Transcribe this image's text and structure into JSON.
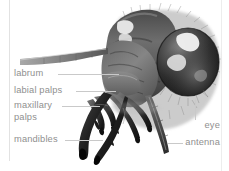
{
  "figure": {
    "background_color": "#ffffff",
    "label_color": "#8f8f8f",
    "leader_color": "#c9c9c9",
    "rule_color": "#e2e2e2"
  },
  "labels": {
    "labrum": "labrum",
    "labial_palps": "labial palps",
    "maxillary": "maxillary",
    "palps": "palps",
    "mandibles": "mandibles",
    "eye": "eye",
    "antenna": "antenna"
  }
}
